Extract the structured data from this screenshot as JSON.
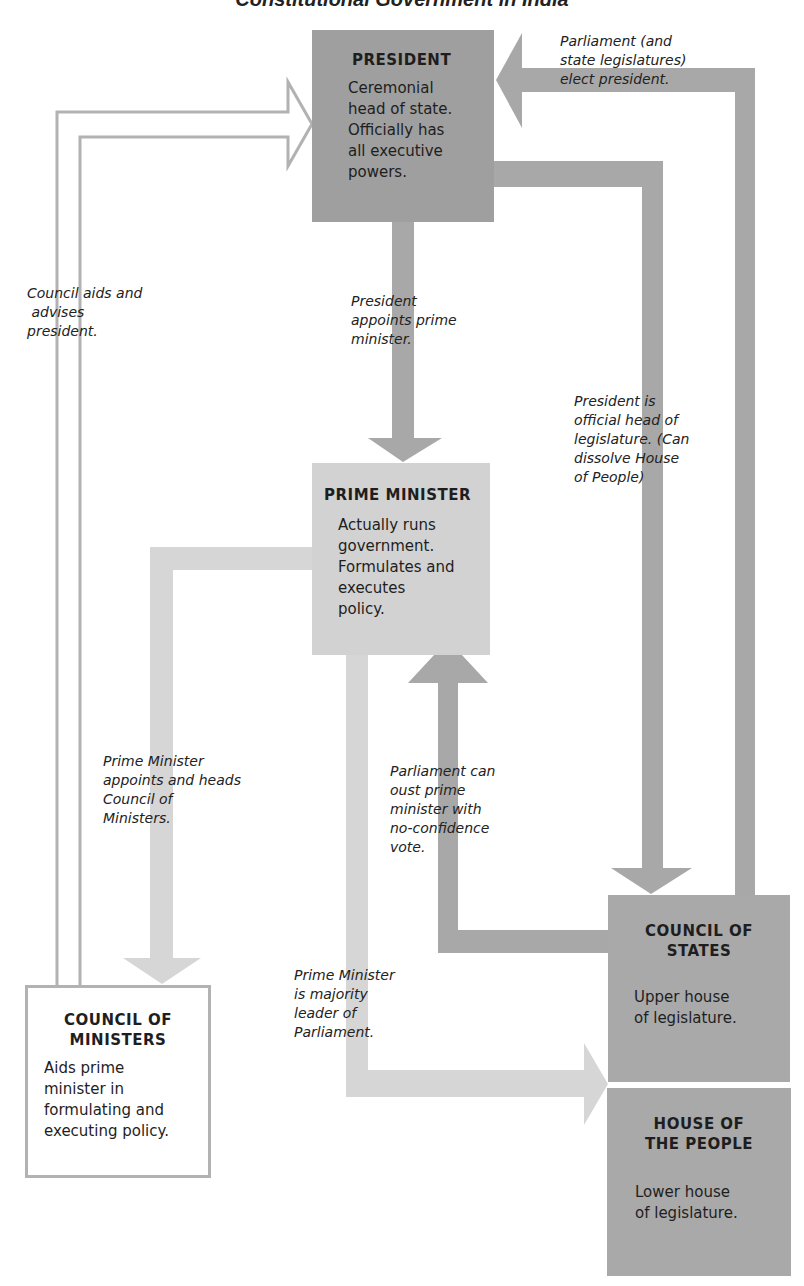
{
  "title": "Constitutional Government in India",
  "colors": {
    "president_box": "#9f9f9f",
    "prime_minister_box": "#d2d2d2",
    "legislature_box": "#a9a9a9",
    "dark_arrow": "#a8a8a8",
    "light_arrow": "#d6d6d6",
    "outline_arrow": "#b2b2b2"
  },
  "boxes": {
    "president": {
      "heading": "PRESIDENT",
      "lines": [
        "Ceremonial",
        "head of state.",
        "Officially has",
        "all executive",
        "powers."
      ]
    },
    "prime_minister": {
      "heading": "PRIME MINISTER",
      "lines": [
        "Actually runs",
        "government.",
        "Formulates and",
        "executes",
        "policy."
      ]
    },
    "council_of_ministers": {
      "heading_lines": [
        "COUNCIL OF",
        "MINISTERS"
      ],
      "lines": [
        "Aids prime",
        "minister in",
        "formulating and",
        "executing policy."
      ]
    },
    "council_of_states": {
      "heading_lines": [
        "COUNCIL OF",
        "STATES"
      ],
      "lines": [
        "Upper house",
        "of legislature."
      ]
    },
    "house_of_people": {
      "heading_lines": [
        "HOUSE OF",
        "THE PEOPLE"
      ],
      "lines": [
        "Lower house",
        "of legislature."
      ]
    }
  },
  "notes": {
    "parliament_elects": [
      "Parliament (and",
      "state legislatures)",
      "elect president."
    ],
    "council_aids": [
      "Council aids and",
      " advises",
      "president."
    ],
    "president_appoints": [
      "President",
      "appoints prime",
      "minister."
    ],
    "president_head_legislature": [
      "President is",
      "official head of",
      "legislature. (Can",
      "dissolve House",
      "of People)"
    ],
    "pm_appoints_council": [
      "Prime Minister",
      "appoints and heads",
      "Council of",
      "Ministers."
    ],
    "parliament_oust": [
      "Parliament can",
      "oust prime",
      "minister with",
      "no-confidence",
      "vote."
    ],
    "pm_majority_leader": [
      "Prime Minister",
      "is majority",
      "leader of",
      "Parliament."
    ]
  }
}
